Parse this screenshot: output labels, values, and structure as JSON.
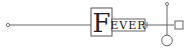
{
  "diagram": {
    "label_initial": "F",
    "label_rest": "EVER",
    "colors": {
      "stroke": "#555555",
      "text": "#222222",
      "background": "#ffffff"
    },
    "nodes": [
      {
        "id": "start-terminal",
        "shape": "small-circle"
      },
      {
        "id": "fever-node",
        "shape": "labeled-box"
      },
      {
        "id": "junction",
        "shape": "cross"
      },
      {
        "id": "top-terminal",
        "shape": "small-circle"
      },
      {
        "id": "right-square",
        "shape": "square"
      },
      {
        "id": "bottom-circle",
        "shape": "circle"
      }
    ]
  }
}
